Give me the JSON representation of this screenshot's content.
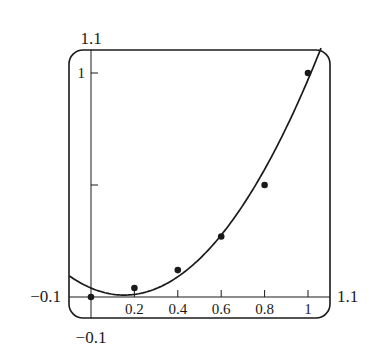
{
  "chart_data": {
    "type": "scatter",
    "title": "",
    "xlabel": "",
    "ylabel": "",
    "xlim": [
      -0.1,
      1.1
    ],
    "ylim": [
      -0.1,
      1.1
    ],
    "grid": false,
    "legend": null,
    "window_labels": {
      "ymax": "1.1",
      "ymin": "−0.1",
      "xmin": "−0.1",
      "xmax": "1.1"
    },
    "x_ticks": [
      {
        "value": 0.2,
        "label": "0.2"
      },
      {
        "value": 0.4,
        "label": "0.4"
      },
      {
        "value": 0.6,
        "label": "0.6"
      },
      {
        "value": 0.8,
        "label": "0.8"
      },
      {
        "value": 1.0,
        "label": "1"
      }
    ],
    "y_ticks": [
      {
        "value": 0.5,
        "label": ""
      },
      {
        "value": 1.0,
        "label": "1"
      }
    ],
    "series": [
      {
        "name": "data points",
        "type": "scatter",
        "x": [
          0,
          0.2,
          0.4,
          0.6,
          0.8,
          1.0
        ],
        "y": [
          0,
          0.04,
          0.12,
          0.27,
          0.5,
          1.0
        ]
      },
      {
        "name": "quadratic fit",
        "type": "line",
        "equation": "y = 1.34x^2 - 0.41x + 0.04",
        "coefficients": {
          "a": 1.34,
          "b": -0.41,
          "c": 0.04
        },
        "x_range": [
          -0.1,
          1.06
        ]
      }
    ]
  }
}
